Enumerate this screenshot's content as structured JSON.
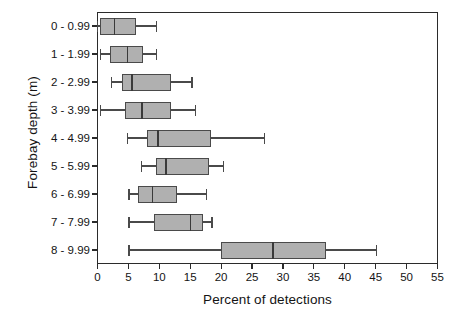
{
  "chart_data": {
    "type": "box",
    "orientation": "horizontal",
    "title": "",
    "xlabel": "Percent of detections",
    "ylabel": "Forebay depth (m)",
    "xlim": [
      0,
      55
    ],
    "ylim_categories": 9,
    "xticks": [
      0,
      5,
      10,
      15,
      20,
      25,
      30,
      35,
      40,
      45,
      50,
      55
    ],
    "xtick_labels": [
      "0",
      "5",
      "10",
      "15",
      "20",
      "25",
      "30",
      "35",
      "40",
      "45",
      "50",
      "55"
    ],
    "grid": false,
    "legend": null,
    "box_fill_color": "#b0b0b0",
    "box_line_color": "#4a4a4a",
    "frame_color": "#2b2b2b",
    "categories": [
      "0 - 0.99",
      "1 - 1.99",
      "2 - 2.99",
      "3 - 3.99",
      "4 - 4.99",
      "5 - 5.99",
      "6 - 6.99",
      "7 - 7.99",
      "8 - 9.99"
    ],
    "boxes": [
      {
        "category": "0 - 0.99",
        "whisker_low": 0.0,
        "q1": 0.4,
        "median": 2.8,
        "q3": 6.2,
        "whisker_high": 9.5
      },
      {
        "category": "1 - 1.99",
        "whisker_low": 0.5,
        "q1": 2.0,
        "median": 4.9,
        "q3": 7.3,
        "whisker_high": 9.5
      },
      {
        "category": "2 - 2.99",
        "whisker_low": 2.2,
        "q1": 4.0,
        "median": 5.6,
        "q3": 11.9,
        "whisker_high": 15.3
      },
      {
        "category": "3 - 3.99",
        "whisker_low": 0.5,
        "q1": 4.4,
        "median": 7.2,
        "q3": 11.9,
        "whisker_high": 15.9
      },
      {
        "category": "4 - 4.99",
        "whisker_low": 4.8,
        "q1": 8.0,
        "median": 9.8,
        "q3": 18.4,
        "whisker_high": 27.0
      },
      {
        "category": "5 - 5.99",
        "whisker_low": 7.1,
        "q1": 9.4,
        "median": 11.1,
        "q3": 18.1,
        "whisker_high": 20.4
      },
      {
        "category": "6 - 6.99",
        "whisker_low": 5.1,
        "q1": 6.6,
        "median": 8.9,
        "q3": 12.8,
        "whisker_high": 17.6
      },
      {
        "category": "7 - 7.99",
        "whisker_low": 5.1,
        "q1": 9.2,
        "median": 15.0,
        "q3": 17.0,
        "whisker_high": 18.5
      },
      {
        "category": "8 - 9.99",
        "whisker_low": 5.1,
        "q1": 20.0,
        "median": 28.4,
        "q3": 37.0,
        "whisker_high": 45.1
      }
    ]
  }
}
